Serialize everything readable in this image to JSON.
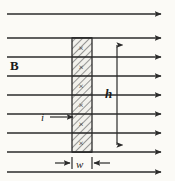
{
  "figure": {
    "background_color": "#fbfaf6",
    "ink_color": "#2b2b2b",
    "width": 175,
    "height": 181,
    "labels": {
      "field": "B",
      "height": "h",
      "current": "i",
      "width": "w"
    },
    "field_lines": {
      "count": 8,
      "direction": "right",
      "x_start": 7,
      "x_end": 168,
      "y_positions": [
        14,
        38,
        57,
        76,
        95,
        114,
        133,
        152,
        172
      ]
    },
    "slab": {
      "x_left": 72,
      "x_right": 92,
      "y_top": 38,
      "y_bottom": 152,
      "hatch": "diagonal",
      "cross_marks": 5,
      "cross_symbol": "×"
    },
    "height_dimension": {
      "x": 117,
      "y_top": 38,
      "y_bottom": 152,
      "arrowheads": "both"
    },
    "width_dimension": {
      "y": 163,
      "x_left_tail": 55,
      "x_right_tail": 110,
      "arrowheads": "inward"
    },
    "current_arrow": {
      "x_tail": 50,
      "x_head": 74,
      "y": 117
    }
  }
}
